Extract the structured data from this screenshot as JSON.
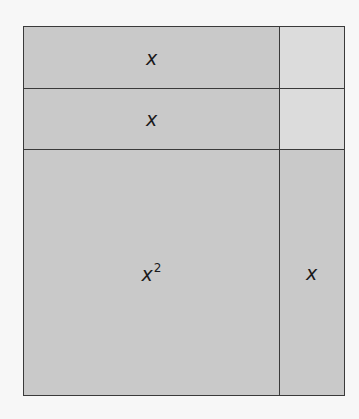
{
  "diagram": {
    "type": "area-model",
    "colors": {
      "background": "#f7f7f7",
      "tile_dark": "#c9c9c9",
      "tile_light": "#dcdcdc",
      "border": "#3a3a3a"
    },
    "tiles": [
      {
        "id": "strip-top",
        "label": "x",
        "shade": "dark"
      },
      {
        "id": "unit-top",
        "label": "",
        "shade": "light"
      },
      {
        "id": "strip-middle",
        "label": "x",
        "shade": "dark"
      },
      {
        "id": "unit-middle",
        "label": "",
        "shade": "light"
      },
      {
        "id": "square-large",
        "label": "x",
        "exponent": "2",
        "shade": "dark"
      },
      {
        "id": "strip-right",
        "label": "x",
        "shade": "dark"
      }
    ]
  }
}
